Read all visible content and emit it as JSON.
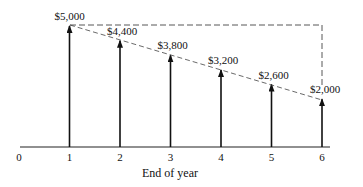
{
  "chart_data": {
    "type": "bar",
    "title": "",
    "xlabel": "End of year",
    "ylabel": "",
    "categories": [
      "1",
      "2",
      "3",
      "4",
      "5",
      "6"
    ],
    "x_ticks": [
      "0",
      "1",
      "2",
      "3",
      "4",
      "5",
      "6"
    ],
    "values": [
      5000,
      4400,
      3800,
      3200,
      2600,
      2000
    ],
    "value_labels": [
      "$5,000",
      "$4,400",
      "$3,800",
      "$3,200",
      "$2,600",
      "$2,000"
    ],
    "annotations": [
      "Dashed line connecting arrow tops (linear decline)",
      "Dashed box from $5,000 level at year 1 to year 6, dropping to $2,000"
    ],
    "grid": false
  }
}
